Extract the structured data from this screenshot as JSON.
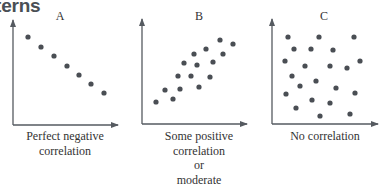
{
  "heading_fragment": "terns",
  "chart_data": [
    {
      "type": "scatter",
      "title": "A",
      "caption": [
        "Perfect negative",
        "correlation"
      ],
      "xlabel": "",
      "ylabel": "",
      "grid": false,
      "points": [
        [
          28,
          37
        ],
        [
          41,
          47
        ],
        [
          54,
          56
        ],
        [
          67,
          66
        ],
        [
          79,
          75
        ],
        [
          91,
          84
        ],
        [
          104,
          93
        ]
      ]
    },
    {
      "type": "scatter",
      "title": "B",
      "caption": [
        "Some positive",
        "correlation",
        "or",
        "moderate"
      ],
      "xlabel": "",
      "ylabel": "",
      "grid": false,
      "points": [
        [
          156,
          102
        ],
        [
          165,
          90
        ],
        [
          173,
          99
        ],
        [
          180,
          89
        ],
        [
          178,
          76
        ],
        [
          191,
          76
        ],
        [
          184,
          63
        ],
        [
          197,
          65
        ],
        [
          199,
          87
        ],
        [
          210,
          77
        ],
        [
          194,
          54
        ],
        [
          206,
          49
        ],
        [
          213,
          62
        ],
        [
          220,
          40
        ],
        [
          223,
          54
        ],
        [
          233,
          44
        ]
      ]
    },
    {
      "type": "scatter",
      "title": "C",
      "caption": [
        "No correlation"
      ],
      "xlabel": "",
      "ylabel": "",
      "grid": false,
      "points": [
        [
          288,
          37
        ],
        [
          319,
          37
        ],
        [
          354,
          37
        ],
        [
          294,
          49
        ],
        [
          311,
          49
        ],
        [
          333,
          50
        ],
        [
          285,
          61
        ],
        [
          305,
          66
        ],
        [
          330,
          66
        ],
        [
          347,
          68
        ],
        [
          360,
          61
        ],
        [
          292,
          76
        ],
        [
          316,
          81
        ],
        [
          300,
          86
        ],
        [
          336,
          88
        ],
        [
          286,
          94
        ],
        [
          355,
          93
        ],
        [
          312,
          100
        ],
        [
          330,
          103
        ],
        [
          296,
          108
        ],
        [
          320,
          116
        ],
        [
          350,
          114
        ]
      ]
    }
  ],
  "colors": {
    "axis": "#555a60",
    "dot": "#4a4e54",
    "text": "#333333"
  }
}
